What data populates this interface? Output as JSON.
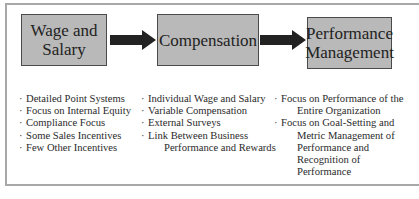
{
  "diagram": {
    "colors": {
      "box_fill": "#b9b9b9",
      "box_border": "#4a4a4a",
      "arrow": "#222222",
      "frame_border": "#a8a8a8"
    },
    "stages": [
      {
        "label_line1": "Wage and",
        "label_line2": "Salary"
      },
      {
        "label_line1": "Compensation",
        "label_line2": ""
      },
      {
        "label_line1": "Performance",
        "label_line2": "Management"
      }
    ],
    "arrows": [
      {
        "from": "Wage and Salary",
        "to": "Compensation",
        "icon": "right-arrow-icon"
      },
      {
        "from": "Compensation",
        "to": "Performance Management",
        "icon": "right-arrow-icon"
      }
    ],
    "bullet_glyph": "·",
    "columns": [
      {
        "items": [
          {
            "line1": "Detailed Point Systems",
            "line2": ""
          },
          {
            "line1": "Focus on Internal Equity",
            "line2": ""
          },
          {
            "line1": "Compliance Focus",
            "line2": ""
          },
          {
            "line1": "Some Sales Incentives",
            "line2": ""
          },
          {
            "line1": "Few Other Incentives",
            "line2": ""
          }
        ]
      },
      {
        "items": [
          {
            "line1": "Individual Wage and Salary",
            "line2": ""
          },
          {
            "line1": "Variable Compensation",
            "line2": ""
          },
          {
            "line1": "External Surveys",
            "line2": ""
          },
          {
            "line1": "Link Between Business",
            "line2": "Performance and Rewards"
          }
        ]
      },
      {
        "items": [
          {
            "line1": "Focus on Performance of the",
            "line2": "Entire Organization"
          },
          {
            "line1": "Focus on Goal-Setting and",
            "line2": "Metric Management of",
            "line3": "Performance and",
            "line4": "Recognition of",
            "line5": "Performance"
          }
        ]
      }
    ]
  }
}
